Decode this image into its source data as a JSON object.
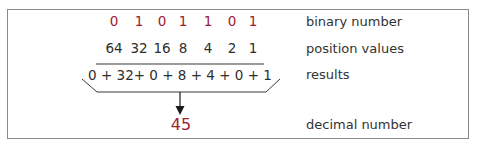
{
  "diagram": {
    "binary_digits": [
      "0",
      "1",
      "0",
      "1",
      "1",
      "0",
      "1"
    ],
    "position_values": [
      "64",
      "32",
      "16",
      "8",
      "4",
      "2",
      "1"
    ],
    "results_expression": "0 + 32+  0 +  8  + 4  + 0  + 1",
    "decimal_result": "45",
    "labels": {
      "binary": "binary number",
      "positions": "position values",
      "results": "results",
      "decimal": "decimal number"
    },
    "colors": {
      "binary_digits": "#9b2230",
      "decimal_result": "#a0232f",
      "text": "#2e2e2e",
      "frame": "#8a8a8a"
    }
  }
}
